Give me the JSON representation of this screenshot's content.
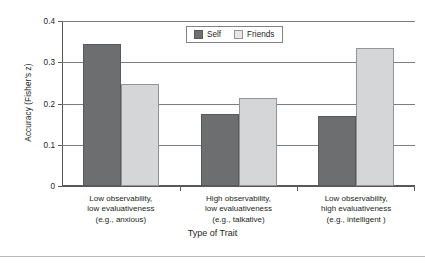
{
  "chart_data": {
    "type": "bar",
    "title": "",
    "xlabel": "Type of Trait",
    "ylabel": "Accuracy (Fisher's z)",
    "ylim": [
      0,
      0.4
    ],
    "ytick_labels": [
      "0",
      "0.1",
      "0.2",
      "0.3",
      "0.4"
    ],
    "ytick_values": [
      0,
      0.1,
      0.2,
      0.3,
      0.4
    ],
    "grid": true,
    "grid_axis": "y",
    "legend_position": "top-center",
    "categories": [
      "Low observability, low evaluativeness (e.g., anxious)",
      "High observability, low evaluativeness (e.g., talkative)",
      "Low observability, high evaluativeness (e.g., intelligent )"
    ],
    "category_lines": [
      [
        "Low observability,",
        "low evaluativeness",
        "(e.g., anxious)"
      ],
      [
        "High observability,",
        "low evaluativeness",
        "(e.g., talkative)"
      ],
      [
        "Low observability,",
        "high evaluativeness",
        "(e.g., intelligent )"
      ]
    ],
    "series": [
      {
        "name": "Self",
        "color": "#6d6e70",
        "values": [
          0.345,
          0.175,
          0.17
        ]
      },
      {
        "name": "Friends",
        "color": "#d5d6d8",
        "values": [
          0.247,
          0.213,
          0.335
        ]
      }
    ]
  },
  "legend": {
    "items": [
      {
        "label": "Self"
      },
      {
        "label": "Friends"
      }
    ]
  }
}
